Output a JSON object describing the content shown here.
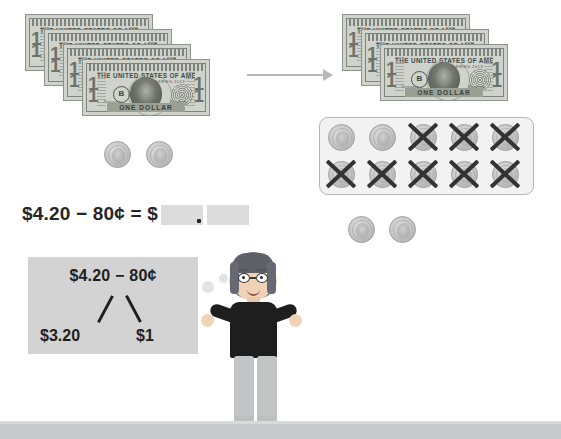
{
  "lesson": {
    "equation_text": "$4.20 − 80¢ = $",
    "decimal_point": ".",
    "answer_boxes": [
      {
        "name": "dollars-answer",
        "value": "",
        "placeholder": ""
      },
      {
        "name": "cents-answer",
        "value": "",
        "placeholder": ""
      }
    ]
  },
  "thought_bubble": {
    "expression": "$4.20 − 80¢",
    "part_left": "$3.20",
    "part_right": "$1"
  },
  "money_left": {
    "bill_count": 4,
    "bill_label_top": "THE UNITED STATES OF AMERICA",
    "bill_label_bottom": "ONE DOLLAR",
    "bill_numeral": "1",
    "bill_seal_letter": "B",
    "bill_serial": "B 00000000 A",
    "bill_series": "SERIES 2013",
    "bill_sig_left": "Treasurer",
    "bill_sig_right": "Secretary",
    "coin_count": 2,
    "coin_type": "dime"
  },
  "money_right": {
    "bill_count": 3,
    "coins_in_grid": 10,
    "coins_crossed_out": 8,
    "coins_below": 2
  },
  "arrow": {
    "direction": "right"
  },
  "colors": {
    "background": "#ffffff",
    "ground": "#c8c9cb",
    "answer_box": "#dcdcdc",
    "thought_box": "#d3d3d3",
    "text": "#262626",
    "cross_mark": "#333333",
    "bill": "#cfd3cc",
    "coin": "#c4c4c4",
    "arrow": "#b9b9b9"
  }
}
